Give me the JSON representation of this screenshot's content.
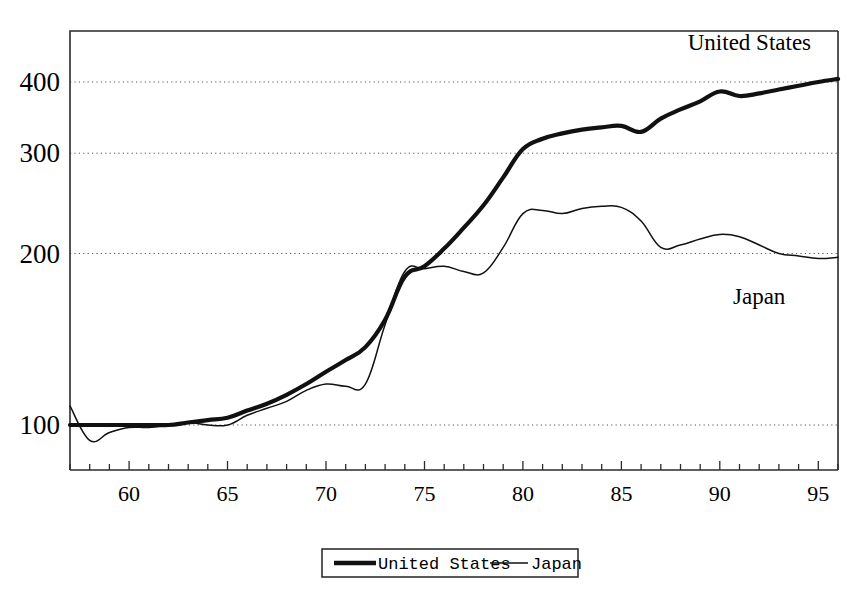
{
  "chart_data": {
    "type": "line",
    "title": "",
    "xlabel": "",
    "ylabel": "",
    "xlim": [
      1957,
      1996
    ],
    "ylim": [
      78,
      520
    ],
    "yscale": "log",
    "grid": true,
    "gridlines": [
      100,
      200,
      300,
      400
    ],
    "y_ticklabels": [
      "100",
      "200",
      "300",
      "400"
    ],
    "x_ticklabels": [
      "60",
      "65",
      "70",
      "75",
      "80",
      "85",
      "90",
      "95"
    ],
    "x_ticks_major": [
      1960,
      1965,
      1970,
      1975,
      1980,
      1985,
      1990,
      1995
    ],
    "x_ticks_minor_step": 1,
    "legend_position": "below-center",
    "x": [
      1957,
      1958,
      1959,
      1960,
      1961,
      1962,
      1963,
      1964,
      1965,
      1966,
      1967,
      1968,
      1969,
      1970,
      1971,
      1972,
      1973,
      1974,
      1975,
      1976,
      1977,
      1978,
      1979,
      1980,
      1981,
      1982,
      1983,
      1984,
      1985,
      1986,
      1987,
      1988,
      1989,
      1990,
      1991,
      1992,
      1993,
      1994,
      1995,
      1996
    ],
    "series": [
      {
        "name": "United States",
        "style": "thick",
        "values": [
          100,
          100,
          100,
          100,
          100,
          100,
          101,
          102,
          103,
          106,
          109,
          113,
          118,
          124,
          130,
          137,
          153,
          182,
          190,
          204,
          222,
          243,
          272,
          305,
          318,
          325,
          330,
          333,
          335,
          327,
          345,
          358,
          370,
          385,
          378,
          382,
          388,
          394,
          400,
          405
        ]
      },
      {
        "name": "Japan",
        "style": "thin",
        "values": [
          108,
          94,
          97,
          99,
          99,
          100,
          101,
          100,
          100,
          104,
          107,
          110,
          115,
          118,
          117,
          118,
          150,
          186,
          188,
          190,
          186,
          185,
          205,
          235,
          238,
          235,
          240,
          242,
          241,
          228,
          205,
          207,
          212,
          216,
          214,
          207,
          200,
          198,
          196,
          197
        ]
      }
    ],
    "annotations": [
      {
        "text": "United States",
        "x": 1991.5,
        "y": 455
      },
      {
        "text": "Japan",
        "x": 1992.0,
        "y": 163
      }
    ]
  },
  "legend": {
    "items": [
      {
        "label": "United States",
        "style": "thick"
      },
      {
        "label": "Japan",
        "style": "thin"
      }
    ]
  }
}
